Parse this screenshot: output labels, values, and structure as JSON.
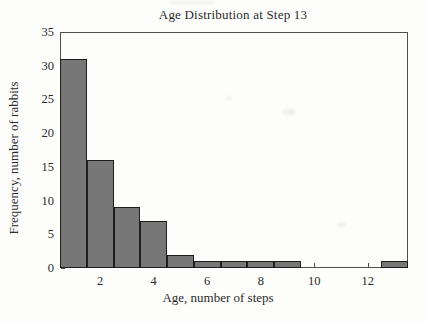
{
  "chart_data": {
    "type": "bar",
    "subtype": "histogram",
    "title": "Age Distribution at Step 13",
    "xlabel": "Age, number of steps",
    "ylabel": "Frequency, number of rabbits",
    "x": [
      1,
      2,
      3,
      4,
      5,
      6,
      7,
      8,
      9,
      10,
      11,
      12,
      13
    ],
    "values": [
      31,
      16,
      9,
      7,
      2,
      1,
      1,
      1,
      1,
      0,
      0,
      0,
      1
    ],
    "bar_width": 1,
    "xlim": [
      0.5,
      13.5
    ],
    "ylim": [
      0,
      35
    ],
    "x_ticks": [
      2,
      4,
      6,
      8,
      10,
      12
    ],
    "y_ticks": [
      0,
      5,
      10,
      15,
      20,
      25,
      30,
      35
    ],
    "grid": false,
    "legend": null,
    "colors": {
      "bar_fill": "#777777",
      "bar_border": "#1e1e1e",
      "axis": "#4f4f4f",
      "text": "#2b2b2b",
      "background": "#fdfdfb"
    }
  }
}
